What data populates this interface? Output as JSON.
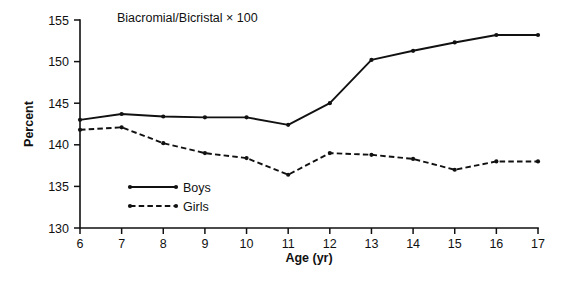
{
  "chart_data": {
    "type": "line",
    "title": "Biacromial/Bicristal × 100",
    "xlabel": "Age (yr)",
    "ylabel": "Percent",
    "x": [
      6,
      7,
      8,
      9,
      10,
      11,
      12,
      13,
      14,
      15,
      16,
      17
    ],
    "xticklabels": [
      "6",
      "7",
      "8",
      "9",
      "10",
      "11",
      "12",
      "13",
      "14",
      "15",
      "16",
      "17"
    ],
    "yticklabels": [
      "130",
      "135",
      "140",
      "145",
      "150",
      "155"
    ],
    "yticks": [
      130,
      135,
      140,
      145,
      150,
      155
    ],
    "xlim": [
      6,
      17
    ],
    "ylim": [
      130,
      155
    ],
    "grid": false,
    "legend_position": "lower-left-inside",
    "series": [
      {
        "name": "Boys",
        "linestyle": "solid",
        "marker": "dot",
        "color": "#111111",
        "values": [
          143.0,
          143.7,
          143.4,
          143.3,
          143.3,
          142.4,
          145.0,
          150.2,
          151.3,
          152.3,
          153.2,
          153.2
        ]
      },
      {
        "name": "Girls",
        "linestyle": "dashed",
        "marker": "dot",
        "color": "#111111",
        "values": [
          141.8,
          142.1,
          140.2,
          139.0,
          138.4,
          136.4,
          139.0,
          138.8,
          138.3,
          137.0,
          138.0,
          138.0
        ]
      }
    ]
  },
  "legend": {
    "entries": [
      {
        "label": "Boys",
        "style": "solid"
      },
      {
        "label": "Girls",
        "style": "dashed"
      }
    ]
  }
}
